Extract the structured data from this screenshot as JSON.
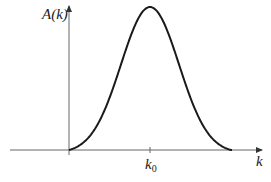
{
  "chart_data": {
    "type": "line",
    "title": "",
    "xlabel": "k",
    "ylabel": "A(k)",
    "x_tick_labels": [
      {
        "label": "k",
        "subscript": "0",
        "position": "peak"
      }
    ],
    "series": [
      {
        "name": "A(k)",
        "shape": "gaussian",
        "center": "k0",
        "x": [
          -1.0,
          -0.8,
          -0.6,
          -0.4,
          -0.2,
          0.0,
          0.2,
          0.4,
          0.6,
          0.8,
          1.0
        ],
        "values": [
          0.0,
          0.08,
          0.3,
          0.62,
          0.91,
          1.0,
          0.91,
          0.62,
          0.3,
          0.08,
          0.0
        ]
      }
    ],
    "grid": false,
    "legend": "none"
  },
  "labels": {
    "y_axis_main": "A(k)",
    "x_axis_main": "k",
    "tick_main": "k",
    "tick_sub": "0"
  },
  "colors": {
    "axis": "#555555",
    "curve": "#1a1a1a",
    "text": "#222222"
  }
}
